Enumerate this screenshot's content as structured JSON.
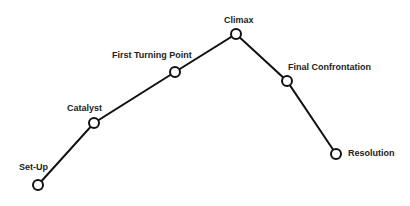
{
  "diagram": {
    "type": "plot-structure-line",
    "stroke_color": "#111111",
    "background": "#ffffff",
    "points": [
      {
        "label": "Set-Up",
        "x": 38,
        "y": 185,
        "lx": 19,
        "ly": 163
      },
      {
        "label": "Catalyst",
        "x": 94,
        "y": 123,
        "lx": 67,
        "ly": 104
      },
      {
        "label": "First Turning Point",
        "x": 175,
        "y": 72,
        "lx": 112,
        "ly": 51
      },
      {
        "label": "Climax",
        "x": 236,
        "y": 34,
        "lx": 224,
        "ly": 16
      },
      {
        "label": "Final Confrontation",
        "x": 287,
        "y": 81,
        "lx": 288,
        "ly": 63
      },
      {
        "label": "Resolution",
        "x": 336,
        "y": 154,
        "lx": 348,
        "ly": 149
      }
    ]
  }
}
